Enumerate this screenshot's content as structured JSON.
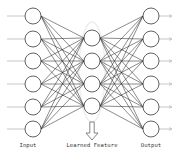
{
  "diagram": {
    "colors": {
      "background": "#ffffff",
      "node_stroke": "#3a3a3a",
      "edge": "#2a2a2a",
      "io_line": "#b8b8b8",
      "bottleneck_halo": "#eeeeee",
      "arrow_stroke": "#555555",
      "label": "#333333"
    },
    "layers": [
      {
        "name": "input",
        "label": "Input",
        "x": 33,
        "node_count": 6,
        "y": [
          16,
          39,
          61,
          84,
          107,
          129
        ]
      },
      {
        "name": "hidden",
        "label": "Learned Feature",
        "x": 92,
        "node_count": 4,
        "y": [
          38,
          61,
          84,
          106
        ]
      },
      {
        "name": "output",
        "label": "Output",
        "x": 151,
        "node_count": 6,
        "y": [
          16,
          39,
          61,
          84,
          107,
          129
        ]
      }
    ],
    "node_radius": 8,
    "connectivity": "fully-connected",
    "labels": {
      "input": "Input",
      "hidden": "Learned Feature",
      "output": "Output"
    },
    "arrow": {
      "direction": "down",
      "x": 92,
      "y_top": 122,
      "y_bottom": 140
    }
  }
}
